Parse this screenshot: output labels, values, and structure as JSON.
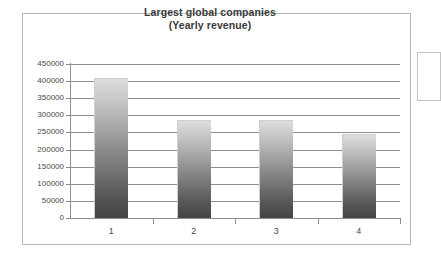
{
  "chart_data": {
    "type": "bar",
    "title": "Largest global companies (Yearly revenue)",
    "title_line1": "Largest global companies",
    "title_line2": "(Yearly revenue)",
    "xlabel": "",
    "ylabel": "",
    "categories": [
      "1",
      "2",
      "3",
      "4"
    ],
    "values": [
      410000,
      286000,
      285000,
      245000
    ],
    "ylim": [
      0,
      450000
    ],
    "ytick_labels": [
      "450000",
      "400000",
      "350000",
      "300000",
      "250000",
      "200000",
      "150000",
      "100000",
      "50000",
      "0"
    ],
    "ytick_values": [
      450000,
      400000,
      350000,
      300000,
      250000,
      200000,
      150000,
      100000,
      50000,
      0
    ],
    "ytick_step": 50000,
    "grid": true,
    "legend": false,
    "legend_position": "right",
    "series": [
      {
        "name": "Yearly revenue",
        "values": [
          410000,
          286000,
          285000,
          245000
        ]
      }
    ],
    "colors": {
      "bar_top": "#dddddd",
      "bar_bottom": "#434343",
      "grid": "#8d8d8d",
      "axis": "#8d8d8d",
      "title": "#3a3a3a",
      "tick_label": "#4a4a4a",
      "frame": "#b9b9b9",
      "background": "#ffffff"
    }
  }
}
